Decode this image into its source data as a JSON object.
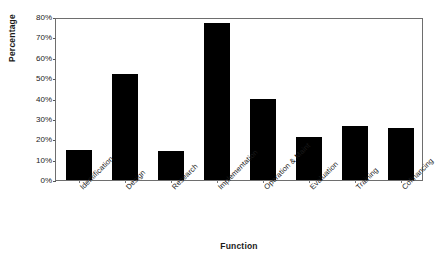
{
  "chart_data": {
    "type": "bar",
    "title": "",
    "subtitle": "",
    "xlabel": "Function",
    "ylabel": "Percentage",
    "categories": [
      "Identification",
      "Design",
      "Research",
      "Implementation",
      "Operation & Maint",
      "Evaluation",
      "Training",
      "Cofinancing"
    ],
    "values": [
      14.7,
      52,
      14.4,
      77,
      40,
      21,
      26.5,
      25.5
    ],
    "ylim": [
      0,
      80
    ],
    "ytick_values": [
      0,
      10,
      20,
      30,
      40,
      50,
      60,
      70,
      80
    ],
    "ytick_labels": [
      "0%",
      "10%",
      "20%",
      "30%",
      "40%",
      "50%",
      "60%",
      "70%",
      "80%"
    ],
    "grid": false,
    "legend": null,
    "bar_color": "#000000",
    "frame_color": "#6e6e6e",
    "background": "#ffffff"
  }
}
